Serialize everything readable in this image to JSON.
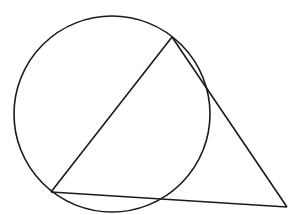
{
  "diagram": {
    "type": "geometry",
    "stroke_color": "#1a1a1a",
    "background": "#ffffff",
    "circle": {
      "cx": 112,
      "cy": 114,
      "r": 98
    },
    "triangle": {
      "vertices": [
        {
          "id": "top",
          "x": 172,
          "y": 37
        },
        {
          "id": "bottom-left",
          "x": 51,
          "y": 192
        },
        {
          "id": "right",
          "x": 287,
          "y": 207
        }
      ]
    },
    "labels": []
  }
}
